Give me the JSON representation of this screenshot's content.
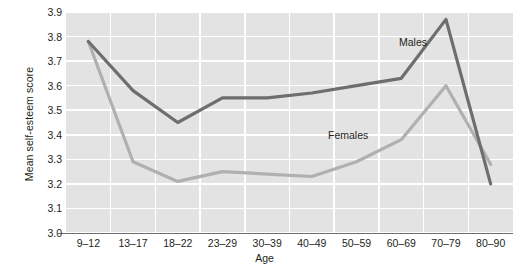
{
  "chart_data": {
    "type": "line",
    "title": "",
    "xlabel": "Age",
    "ylabel": "Mean self-esteem score",
    "categories": [
      "9-12",
      "13-17",
      "18-22",
      "23-29",
      "30-39",
      "40-49",
      "50-59",
      "60-69",
      "70-79",
      "80-90"
    ],
    "ylim": [
      3.0,
      3.9
    ],
    "yticks": [
      "3.0",
      "3.1",
      "3.2",
      "3.3",
      "3.4",
      "3.5",
      "3.6",
      "3.7",
      "3.8",
      "3.9"
    ],
    "grid": true,
    "legend_position": "inline-annotations",
    "series": [
      {
        "name": "Males",
        "color": "#6e6e6e",
        "values": [
          3.78,
          3.58,
          3.45,
          3.55,
          3.55,
          3.57,
          3.6,
          3.63,
          3.87,
          3.2
        ]
      },
      {
        "name": "Females",
        "color": "#b0b0b0",
        "values": [
          3.78,
          3.29,
          3.21,
          3.25,
          3.24,
          3.23,
          3.29,
          3.38,
          3.6,
          3.28
        ]
      }
    ],
    "annotations": [
      {
        "text": "Males",
        "series": "Males"
      },
      {
        "text": "Females",
        "series": "Females"
      }
    ],
    "colors": {
      "plot_background": "#e3e3e3",
      "gridline": "#ffffff",
      "axis": "#6d6e71",
      "text": "#231f20"
    }
  }
}
